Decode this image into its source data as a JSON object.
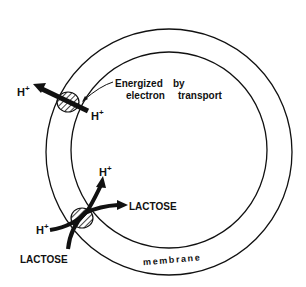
{
  "diagram": {
    "type": "cell membrane transport schematic",
    "labels": {
      "h_out_top": "H",
      "h_in_top": "H",
      "plus": "+",
      "energized_line1": "Energized",
      "energized_by": "by",
      "energized_line2": "electron",
      "energized_transport": "transport",
      "h_in_bottom": "H",
      "h_out_bottom": "H",
      "lactose_out": "LACTOSE",
      "lactose_in": "LACTOSE",
      "membrane": "membrane"
    },
    "colors": {
      "stroke": "#111111",
      "background": "#ffffff"
    }
  }
}
